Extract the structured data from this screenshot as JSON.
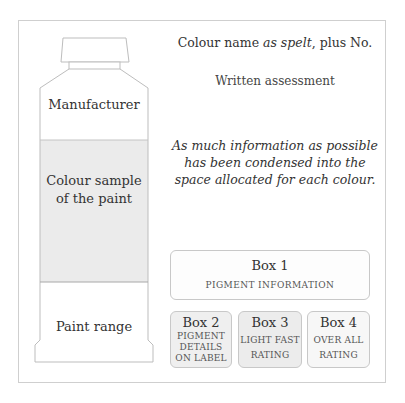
{
  "diagram": {
    "header": {
      "colour_name_prefix": "Colour name ",
      "colour_name_italic": "as spelt",
      "colour_name_suffix": ", plus  No.",
      "written_assessment": "Written assessment"
    },
    "note": "As much information as possible has been condensed into the space allocated for each colour.",
    "tube": {
      "manufacturer": "Manufacturer",
      "colour_sample_line1": "Colour sample",
      "colour_sample_line2": "of the paint",
      "paint_range": "Paint range"
    },
    "boxes": [
      {
        "title": "Box 1",
        "lines": [
          "PIGMENT  INFORMATION"
        ]
      },
      {
        "title": "Box 2",
        "lines": [
          "PIGMENT",
          "DETAILS",
          "ON LABEL"
        ]
      },
      {
        "title": "Box 3",
        "lines": [
          "LIGHT FAST",
          "RATING"
        ]
      },
      {
        "title": "Box 4",
        "lines": [
          "OVER ALL",
          "RATING"
        ]
      }
    ],
    "colors": {
      "outline": "#bdbdbd",
      "sample_fill": "#ebebeb",
      "text": "#333333"
    }
  }
}
